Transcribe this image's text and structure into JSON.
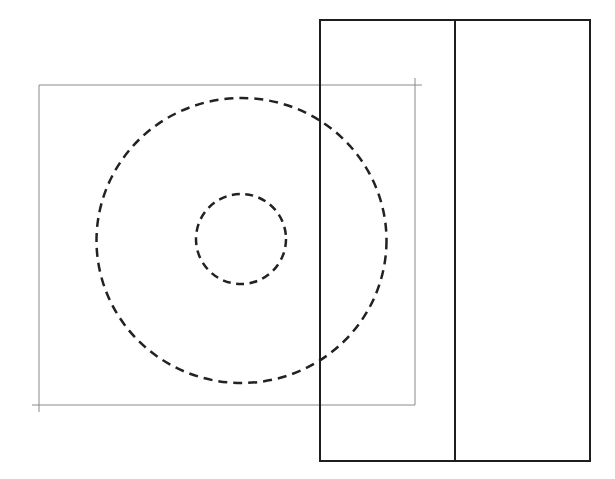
{
  "diagram": {
    "canvas": {
      "width": 615,
      "height": 479,
      "background": "#ffffff"
    },
    "colors": {
      "thin_line": "#8a8a8a",
      "thick_line": "#1e1e1e",
      "dashed": "#222222"
    },
    "thin_frame": {
      "x": 39,
      "y": 85,
      "width": 376,
      "height": 320,
      "overshoot": {
        "top_right_x": 422,
        "top_right_y": 78,
        "bottom_left_x": 32,
        "bottom_left_y": 412
      }
    },
    "thick_frame": {
      "x": 320,
      "y": 20,
      "width": 270,
      "height": 441,
      "divider_x": 455
    },
    "outer_circle": {
      "cx": 241.5,
      "cy": 240.5,
      "rx": 145,
      "ry": 142.5,
      "style": "dashed"
    },
    "inner_circle": {
      "cx": 241,
      "cy": 239,
      "r": 45,
      "style": "dashed"
    }
  }
}
